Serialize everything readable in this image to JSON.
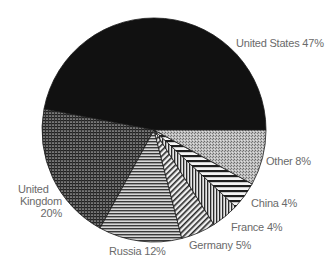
{
  "chart_data": {
    "type": "pie",
    "title": "",
    "categories": [
      "United States",
      "United Kingdom",
      "Russia",
      "Germany",
      "France",
      "China",
      "Other"
    ],
    "values": [
      47,
      20,
      12,
      5,
      4,
      4,
      8
    ],
    "unit": "%",
    "start_angle_deg": 0,
    "direction": "counterclockwise",
    "legend": "none (direct labels)",
    "slices": [
      {
        "name": "United States",
        "value": 47,
        "label": "United States 47%",
        "pattern": "solid",
        "color": "#111111"
      },
      {
        "name": "United Kingdom",
        "value": 20,
        "label": "United Kingdom 20%",
        "pattern": "crosshatch",
        "color": "#444444"
      },
      {
        "name": "Russia",
        "value": 12,
        "label": "Russia 12%",
        "pattern": "horizontal",
        "color": "#555555"
      },
      {
        "name": "Germany",
        "value": 5,
        "label": "Germany 5%",
        "pattern": "diagonal",
        "color": "#333333"
      },
      {
        "name": "France",
        "value": 4,
        "label": "France 4%",
        "pattern": "vertical",
        "color": "#333333"
      },
      {
        "name": "China",
        "value": 4,
        "label": "China 4%",
        "pattern": "horizontal-wide",
        "color": "#222222"
      },
      {
        "name": "Other",
        "value": 8,
        "label": "Other 8%",
        "pattern": "stipple",
        "color": "#9a9a9a"
      }
    ]
  },
  "labels": {
    "us": "United States 47%",
    "uk_line1": "United",
    "uk_line2": "Kingdom",
    "uk_line3": "20%",
    "russia": "Russia 12%",
    "germany": "Germany 5%",
    "france": "France 4%",
    "china": "China 4%",
    "other": "Other 8%"
  }
}
